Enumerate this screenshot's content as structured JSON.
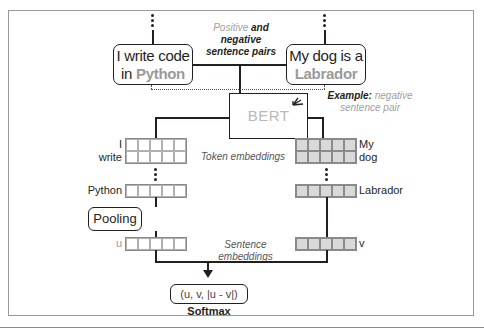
{
  "diagram": {
    "type": "SBERT training architecture (siamese BERT with softmax classifier)",
    "sentences": {
      "left": {
        "text_before": "I write code",
        "text_in": "in ",
        "highlight": "Python"
      },
      "right": {
        "text_before": "My dog is a",
        "highlight": "Labrador"
      }
    },
    "captions": {
      "pairs_positive": "Positive",
      "pairs_and_negative": " and negative",
      "pairs_line2": "sentence pairs",
      "example_bold": "Example:",
      "example_rest": " negative",
      "example_line2": "sentence pair",
      "token_embeddings": "Token embeddings",
      "sentence_embeddings": "Sentence embeddings"
    },
    "model": {
      "label": "BERT"
    },
    "left_tokens": [
      "I",
      "write",
      "Python"
    ],
    "right_tokens": [
      "My",
      "dog",
      "Labrador"
    ],
    "pooling": {
      "label": "Pooling"
    },
    "sentence_vectors": {
      "left": "u",
      "right": "v"
    },
    "output": {
      "formula": "(u, v, |u - v|)",
      "classifier": "Softmax"
    },
    "colors": {
      "line": "#231f20",
      "highlight_gray": "#9a9a9a",
      "dark_cell": "#d9d9d9",
      "light_cell": "#ffffff"
    }
  }
}
